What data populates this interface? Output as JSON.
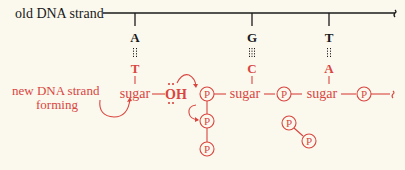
{
  "colors": {
    "old_strand": "#1a1a1a",
    "new_strand": "#d9453f",
    "background": "#fbf9ee"
  },
  "labels": {
    "old_strand": "old DNA strand",
    "new_strand_line1": "new DNA strand",
    "new_strand_line2": "forming"
  },
  "old_bases": [
    "A",
    "G",
    "T"
  ],
  "new_bases": [
    "T",
    "C",
    "A"
  ],
  "backbone": {
    "sugar": "sugar",
    "oh": "OH",
    "oh_dots": "..",
    "phosphate": "P"
  }
}
